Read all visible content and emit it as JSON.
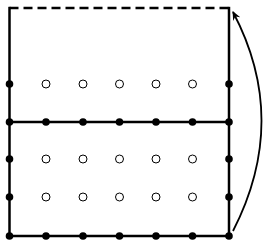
{
  "diagram": {
    "width": 272,
    "height": 247,
    "colors": {
      "stroke": "#000000",
      "background": "#ffffff"
    },
    "frame": {
      "left": 9.5,
      "right": 229,
      "top": 8,
      "bottom": 236,
      "middle": 122
    },
    "columns_x": [
      9.5,
      46,
      83,
      119.5,
      156,
      192.5,
      229
    ],
    "rows_y": [
      84,
      122,
      159,
      197,
      236
    ],
    "filled_dot_radius": 3.8,
    "open_dot_radius": 4,
    "arrow": {
      "from": [
        233,
        231
      ],
      "control": [
        290,
        120
      ],
      "to": [
        233,
        12
      ]
    },
    "legend": {
      "filled": "boundary vertex",
      "open": "interior vertex",
      "dashed": "identified edge"
    }
  }
}
